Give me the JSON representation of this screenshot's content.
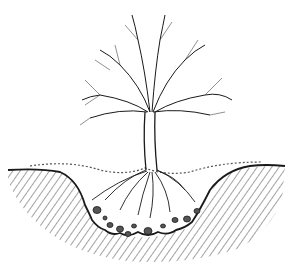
{
  "illustration": {
    "subject": "tree planted in a dug pit with spreading roots and stones",
    "style": "black ink line drawing",
    "colors": {
      "ink": "#1a1a1a",
      "soil_hatch": "#8a8a8a",
      "background": "#ffffff"
    }
  }
}
